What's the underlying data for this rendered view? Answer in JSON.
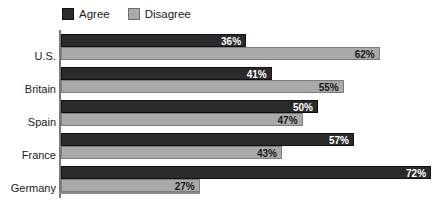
{
  "chart_data": {
    "type": "bar",
    "orientation": "horizontal",
    "title": "",
    "subtitle": "",
    "xlabel": "",
    "ylabel": "",
    "xlim": [
      0,
      75
    ],
    "grid": false,
    "legend_position": "top-left",
    "value_suffix": "%",
    "categories": [
      "U.S.",
      "Britain",
      "Spain",
      "France",
      "Germany"
    ],
    "series": [
      {
        "name": "Agree",
        "color": "#2b2b2b",
        "values": [
          36,
          41,
          50,
          57,
          72
        ],
        "labels": [
          "36%",
          "41%",
          "50%",
          "57%",
          "72%"
        ]
      },
      {
        "name": "Disagree",
        "color": "#a9a9a9",
        "values": [
          62,
          55,
          47,
          43,
          27
        ],
        "labels": [
          "62%",
          "55%",
          "47%",
          "43%",
          "27%"
        ]
      }
    ]
  },
  "legend": {
    "items": [
      {
        "label": "Agree",
        "color": "#2b2b2b"
      },
      {
        "label": "Disagree",
        "color": "#a9a9a9"
      }
    ]
  },
  "axis": {
    "category_labels": [
      "U.S.",
      "Britain",
      "Spain",
      "France",
      "Germany"
    ]
  }
}
